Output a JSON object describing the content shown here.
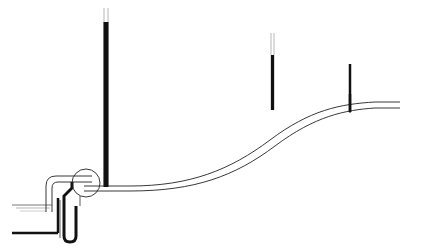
{
  "diagram": {
    "type": "pump-pipeline-hydraulic-grade-line",
    "labels": {
      "hgl": "H.G.L.",
      "pd_num": "p",
      "pd_sub": "d",
      "pd_den": "γ",
      "ps_num": "p",
      "ps_sub": "s",
      "ps_den": "γ",
      "d_point": "d",
      "s_point": "s",
      "zdiff_open": "(z",
      "zdiff_sub1": "d",
      "zdiff_mid": " − z",
      "zdiff_sub2": "s",
      "zdiff_close": ")"
    },
    "colors": {
      "ink": "#111111",
      "line": "#333333",
      "background": "#ffffff"
    }
  }
}
